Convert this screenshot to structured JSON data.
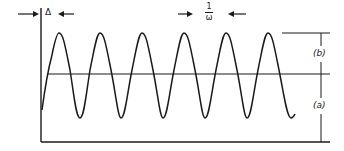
{
  "diagram": {
    "title": "",
    "labels": {
      "delta": "Δ",
      "period_numerator": "1",
      "period_denominator": "ω",
      "b": "(b)",
      "a": "(a)"
    },
    "colors": {
      "stroke": "#1a1a1a",
      "background": "#ffffff"
    },
    "waveform": {
      "type": "sinusoid",
      "cycles": 6,
      "start_offset_label": "Δ",
      "period_label": "1/ω",
      "peak_count": 6
    }
  }
}
